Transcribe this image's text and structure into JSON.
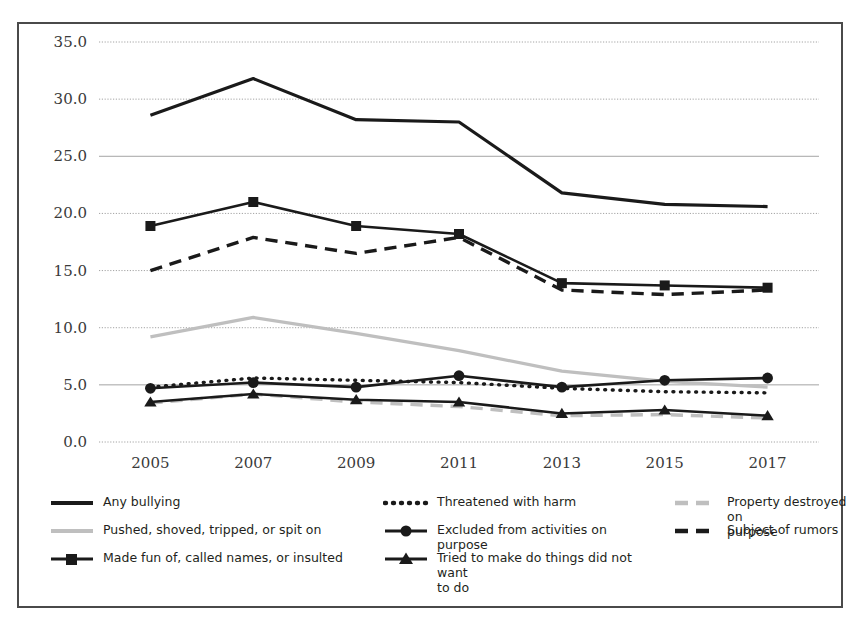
{
  "chart_data": {
    "type": "line",
    "title": "",
    "subtitle": "",
    "xlabel": "",
    "ylabel": "",
    "categories": [
      "2005",
      "2007",
      "2009",
      "2011",
      "2013",
      "2015",
      "2017"
    ],
    "x": [
      2005,
      2007,
      2009,
      2011,
      2013,
      2015,
      2017
    ],
    "ylim": [
      0.0,
      35.0
    ],
    "ytick_values": [
      0.0,
      5.0,
      10.0,
      15.0,
      20.0,
      25.0,
      30.0,
      35.0
    ],
    "ytick_labels": [
      "0.0",
      "5.0",
      "10.0",
      "15.0",
      "20.0",
      "25.0",
      "30.0",
      "35.0"
    ],
    "grid": true,
    "legend_position": "bottom",
    "series": [
      {
        "name": "Any bullying",
        "style": "solid",
        "marker": "none",
        "color": "#1a1a1a",
        "width": 3.2,
        "values": [
          28.6,
          31.8,
          28.2,
          28.0,
          21.8,
          20.8,
          20.6
        ]
      },
      {
        "name": "Pushed, shoved, tripped, or spit on",
        "style": "solid",
        "marker": "none",
        "color": "#bfbfbf",
        "width": 3.2,
        "values": [
          9.2,
          10.9,
          9.5,
          8.0,
          6.2,
          5.3,
          4.8
        ]
      },
      {
        "name": "Made fun of, called names, or insulted",
        "style": "solid",
        "marker": "square",
        "color": "#1a1a1a",
        "width": 2.6,
        "values": [
          18.9,
          21.0,
          18.9,
          18.2,
          13.9,
          13.7,
          13.5
        ]
      },
      {
        "name": "Threatened with harm",
        "style": "dotted",
        "marker": "none",
        "color": "#1a1a1a",
        "width": 3.4,
        "values": [
          4.8,
          5.6,
          5.4,
          5.2,
          4.7,
          4.4,
          4.3
        ]
      },
      {
        "name": "Excluded from activities on purpose",
        "style": "solid",
        "marker": "circle",
        "color": "#1a1a1a",
        "width": 2.6,
        "values": [
          4.7,
          5.2,
          4.8,
          5.8,
          4.8,
          5.4,
          5.6
        ]
      },
      {
        "name": "Tried to make do things did not want to do",
        "style": "solid",
        "marker": "triangle",
        "color": "#1a1a1a",
        "width": 2.6,
        "values": [
          3.5,
          4.2,
          3.7,
          3.5,
          2.5,
          2.8,
          2.3
        ]
      },
      {
        "name": "Property destroyed on purpose",
        "style": "dashed",
        "marker": "none",
        "color": "#bfbfbf",
        "width": 3.4,
        "values": [
          3.4,
          4.2,
          3.5,
          3.1,
          2.3,
          2.4,
          2.1
        ]
      },
      {
        "name": "Subject of rumors",
        "style": "dashed",
        "marker": "none",
        "color": "#1a1a1a",
        "width": 3.4,
        "values": [
          15.0,
          17.9,
          16.5,
          17.9,
          13.3,
          12.9,
          13.3
        ]
      }
    ]
  },
  "legend": {
    "entries": [
      {
        "label": "Any bullying",
        "key": "any-bullying"
      },
      {
        "label": "Threatened with harm",
        "key": "threatened-with-harm"
      },
      {
        "label": "Property destroyed on\npurpose",
        "key": "property-destroyed-on-purpose"
      },
      {
        "label": "Pushed, shoved, tripped, or spit on",
        "key": "pushed-shoved-tripped-or-spit-on"
      },
      {
        "label": "Excluded from activities on purpose",
        "key": "excluded-from-activities-on-purpose"
      },
      {
        "label": "Subject of rumors",
        "key": "subject-of-rumors"
      },
      {
        "label": "Made fun of, called names, or insulted",
        "key": "made-fun-of-called-names-or-insulted"
      },
      {
        "label": "Tried to make do things did not want\nto do",
        "key": "tried-to-make-do-things-did-not-want-to-do"
      }
    ]
  },
  "colors": {
    "ink": "#1a1a1a",
    "gray_series": "#bfbfbf",
    "gridline": "#9a9a9a",
    "frame": "#4a4a4a",
    "background": "#ffffff"
  }
}
